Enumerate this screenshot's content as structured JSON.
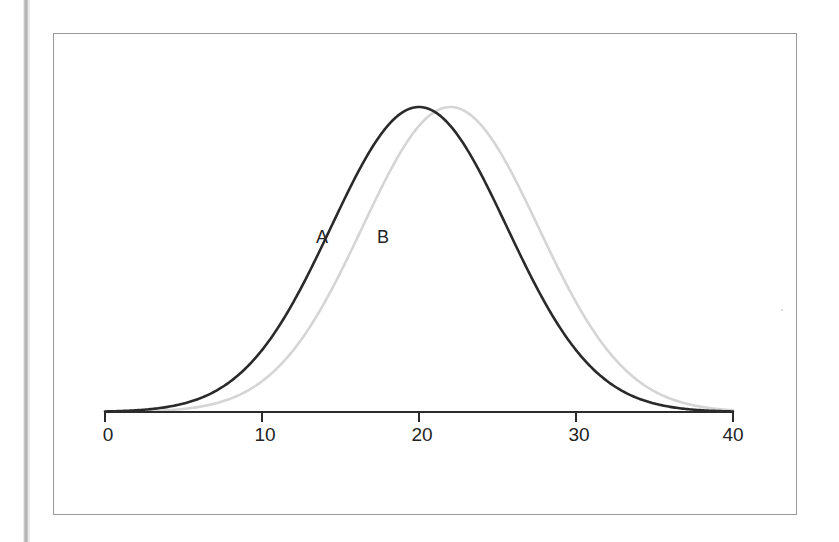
{
  "page": {
    "background_color": "#ffffff",
    "width": 839,
    "height": 542,
    "scan_edge_color": "#a9a9a9",
    "frame_color": "#9a9a9a"
  },
  "figure": {
    "frame": {
      "x": 53,
      "y": 33,
      "width": 744,
      "height": 482
    }
  },
  "chart_data": {
    "type": "line",
    "title": "",
    "subtitle": "",
    "xlabel": "",
    "ylabel": "",
    "xlim": [
      0,
      40
    ],
    "ylim": [
      0,
      1
    ],
    "grid": false,
    "legend_position": "inline-annotation",
    "x_ticks": [
      0,
      10,
      20,
      30,
      40
    ],
    "x_tick_labels": [
      "0",
      "10",
      "20",
      "30",
      "40"
    ],
    "y_axis_visible": false,
    "annotations": [
      {
        "text": "A",
        "x": 14.2,
        "y": 0.555,
        "series": "A"
      },
      {
        "text": "B",
        "x": 18.1,
        "y": 0.555,
        "series": "B"
      }
    ],
    "series": [
      {
        "name": "A",
        "label": "A",
        "color": "#2a2a2a",
        "line_width": 2.6,
        "distribution": "normal",
        "mean": 20.0,
        "sigma": 5.6,
        "peak_height": 1.0,
        "x": [
          0,
          2,
          4,
          6,
          8,
          10,
          12,
          14,
          16,
          18,
          20,
          22,
          24,
          26,
          28,
          30,
          32,
          34,
          36,
          38,
          40
        ],
        "values": [
          0.002,
          0.01,
          0.036,
          0.1,
          0.218,
          0.386,
          0.59,
          0.787,
          0.932,
          0.995,
          1.0,
          0.995,
          0.932,
          0.787,
          0.59,
          0.386,
          0.218,
          0.1,
          0.036,
          0.01,
          0.002
        ]
      },
      {
        "name": "B",
        "label": "B",
        "color": "#d5d5d5",
        "line_width": 2.6,
        "distribution": "normal",
        "mean": 22.0,
        "sigma": 5.6,
        "peak_height": 1.0,
        "x": [
          0,
          2,
          4,
          6,
          8,
          10,
          12,
          14,
          16,
          18,
          20,
          22,
          24,
          26,
          28,
          30,
          32,
          34,
          36,
          38,
          40
        ],
        "values": [
          0.0,
          0.002,
          0.01,
          0.036,
          0.1,
          0.218,
          0.386,
          0.59,
          0.787,
          0.932,
          0.995,
          1.0,
          0.995,
          0.932,
          0.787,
          0.59,
          0.386,
          0.218,
          0.1,
          0.036,
          0.01
        ]
      }
    ]
  },
  "axis": {
    "baseline_color": "#2b2b2b",
    "tick_direction": "down",
    "tick_length": 9
  }
}
